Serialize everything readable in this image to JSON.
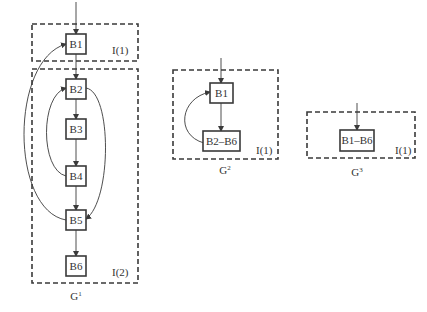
{
  "diagram": {
    "graphs": [
      {
        "name": "G",
        "superscript": "1",
        "regions": [
          {
            "label": "I(1)",
            "contains": [
              "B1"
            ]
          },
          {
            "label": "I(2)",
            "contains": [
              "B2",
              "B3",
              "B4",
              "B5",
              "B6"
            ]
          }
        ],
        "nodes": [
          "B1",
          "B2",
          "B3",
          "B4",
          "B5",
          "B6"
        ],
        "edges": [
          [
            "entry",
            "B1"
          ],
          [
            "B1",
            "B2"
          ],
          [
            "B2",
            "B3"
          ],
          [
            "B3",
            "B4"
          ],
          [
            "B4",
            "B5"
          ],
          [
            "B5",
            "B6"
          ],
          [
            "B4",
            "B2"
          ],
          [
            "B2",
            "B5"
          ],
          [
            "B5",
            "B1"
          ]
        ]
      },
      {
        "name": "G",
        "superscript": "2",
        "regions": [
          {
            "label": "I(1)",
            "contains": [
              "B1",
              "B2–B6"
            ]
          }
        ],
        "nodes": [
          "B1",
          "B2–B6"
        ],
        "edges": [
          [
            "entry",
            "B1"
          ],
          [
            "B1",
            "B2–B6"
          ],
          [
            "B2–B6",
            "B1"
          ]
        ]
      },
      {
        "name": "G",
        "superscript": "3",
        "regions": [
          {
            "label": "I(1)",
            "contains": [
              "B1–B6"
            ]
          }
        ],
        "nodes": [
          "B1–B6"
        ],
        "edges": [
          [
            "entry",
            "B1–B6"
          ]
        ]
      }
    ]
  }
}
